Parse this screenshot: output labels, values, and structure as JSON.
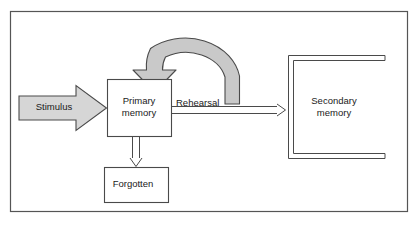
{
  "diagram": {
    "frame": {
      "name": "outer-frame",
      "border_color": "#555555",
      "background": "#ffffff"
    },
    "nodes": {
      "stimulus": {
        "label": "Stimulus",
        "shape": "block-arrow-right",
        "fill": "#d6d6d6",
        "stroke": "#4a4a4a"
      },
      "primary_memory": {
        "label": "Primary\nmemory",
        "line1": "Primary",
        "line2": "memory",
        "shape": "rectangle",
        "fill": "#ffffff",
        "stroke": "#4a4a4a"
      },
      "secondary_memory": {
        "label": "Secondary\nmemory",
        "line1": "Secondary",
        "line2": "memory",
        "shape": "open-bracket",
        "fill": "#ffffff",
        "stroke": "#4a4a4a"
      },
      "forgotten": {
        "label": "Forgotten",
        "shape": "rectangle",
        "fill": "#ffffff",
        "stroke": "#4a4a4a"
      }
    },
    "connectors": {
      "rehearsal_transfer": {
        "label": "Rehearsal",
        "style": "double-line-arrow",
        "from": "primary_memory",
        "to": "secondary_memory",
        "stroke": "#4a4a4a"
      },
      "rehearsal_loop": {
        "label": "",
        "style": "thick-curved-block-arrow",
        "from": "primary_memory",
        "to": "primary_memory",
        "fill": "#c9c9c9",
        "stroke": "#4a4a4a"
      },
      "forgetting": {
        "label": "",
        "style": "double-line-arrow-down",
        "from": "primary_memory",
        "to": "forgotten",
        "stroke": "#4a4a4a"
      }
    }
  }
}
